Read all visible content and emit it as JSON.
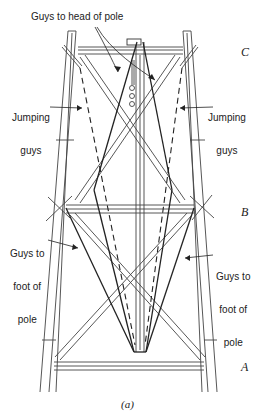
{
  "figure": {
    "caption": "(a)",
    "level_labels": {
      "top": "C",
      "middle": "B",
      "bottom": "A"
    },
    "callouts": {
      "head_guys": "Guys to head of pole",
      "jumping_left_line1": "Jumping",
      "jumping_left_line2": "guys",
      "jumping_right_line1": "Jumping",
      "jumping_right_line2": "guys",
      "foot_left_line1": "Guys to",
      "foot_left_line2": "foot of",
      "foot_left_line3": "pole",
      "foot_right_line1": "Guys to",
      "foot_right_line2": "foot of",
      "foot_right_line3": "pole"
    },
    "colors": {
      "line": "#333333",
      "background": "#ffffff"
    }
  }
}
